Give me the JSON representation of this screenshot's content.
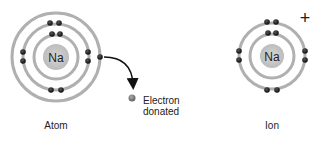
{
  "atom": {
    "nucleus_label": "Na",
    "caption": "Atom",
    "shells": [
      2,
      8,
      1
    ]
  },
  "ion": {
    "nucleus_label": "Na",
    "caption": "Ion",
    "charge": "+",
    "shells": [
      2,
      8
    ]
  },
  "donated": {
    "line1": "Electron",
    "line2": "donated"
  },
  "colors": {
    "shell": "#a8a8a8",
    "nucleus": "#c8c8c8",
    "electron": "#1a1a1a",
    "donated_electron": "#777777",
    "arrow": "#111111"
  }
}
